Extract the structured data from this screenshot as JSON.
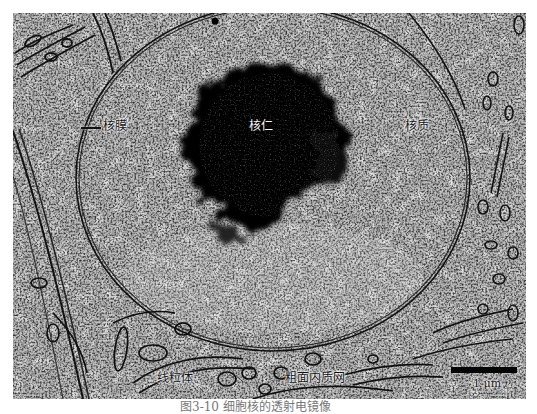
{
  "figure": {
    "type": "transmission electron micrograph",
    "background_color": "#ffffff",
    "image_tone": "grayscale",
    "labels": {
      "nuclear_envelope": "核膜",
      "nucleolus": "核仁",
      "nucleoplasm": "核质",
      "mitochondrion": "线粒体",
      "rough_er": "粗面内质网"
    },
    "scale_bar": {
      "label": "1 μm",
      "color": "#050505"
    },
    "caption": "图3-10  细胞核的透射电镜像"
  }
}
